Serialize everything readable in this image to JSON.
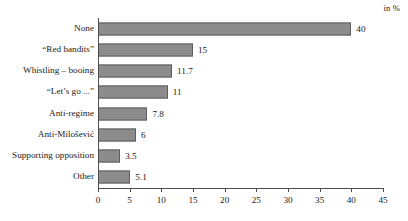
{
  "chart_data": {
    "type": "bar",
    "orientation": "horizontal",
    "title": "",
    "xlabel": "",
    "ylabel": "",
    "annotation": "in %",
    "xlim": [
      0,
      45
    ],
    "xticks": [
      0,
      5,
      10,
      15,
      20,
      25,
      30,
      35,
      40,
      45
    ],
    "grid": false,
    "legend": false,
    "bar_color": "#8c8c8c",
    "bar_border_color": "#5c5c5c",
    "axis_color": "#4d4d4d",
    "categories": [
      "None",
      "“Red bandits”",
      "Whistling – booing",
      "“Let’s go ...”",
      "Anti-regime",
      "Anti-Milošević",
      "Supporting opposition",
      "Other"
    ],
    "values": [
      40,
      15,
      11.7,
      11,
      7.8,
      6,
      3.5,
      5.1
    ],
    "value_labels": [
      "40",
      "15",
      "11.7",
      "11",
      "7.8",
      "6",
      "3.5",
      "5.1"
    ]
  }
}
